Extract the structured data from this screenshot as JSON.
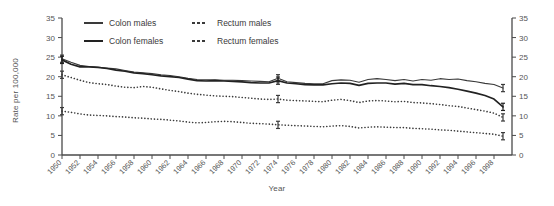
{
  "chart_data": {
    "type": "line",
    "title": "",
    "xlabel": "Year",
    "ylabel": "Rate per 100,000",
    "xlim": [
      1950,
      2000
    ],
    "ylim": [
      0,
      35
    ],
    "ytick_step": 5,
    "yticks": [
      0,
      5,
      10,
      15,
      20,
      25,
      30,
      35
    ],
    "xticks": [
      1950,
      1952,
      1954,
      1956,
      1958,
      1960,
      1962,
      1964,
      1966,
      1968,
      1970,
      1972,
      1974,
      1976,
      1978,
      1980,
      1982,
      1984,
      1986,
      1988,
      1990,
      1992,
      1994,
      1996,
      1998
    ],
    "xtick_labels": [
      "1950",
      "1952",
      "1954",
      "1956",
      "1958",
      "1960",
      "1962",
      "1964",
      "1966",
      "1968",
      "1970",
      "1972",
      "1974",
      "1976",
      "1978",
      "1980",
      "1982",
      "1984",
      "1986",
      "1988",
      "1990",
      "1992",
      "1994",
      "1996",
      "1998"
    ],
    "grid": false,
    "dual_y_axis": true,
    "legend_position": "top-left-inside",
    "error_bar_years": [
      1950,
      1974,
      1999
    ],
    "x": [
      1950,
      1951,
      1952,
      1953,
      1954,
      1955,
      1956,
      1957,
      1958,
      1959,
      1960,
      1961,
      1962,
      1963,
      1964,
      1965,
      1966,
      1967,
      1968,
      1969,
      1970,
      1971,
      1972,
      1973,
      1974,
      1975,
      1976,
      1977,
      1978,
      1979,
      1980,
      1981,
      1982,
      1983,
      1984,
      1985,
      1986,
      1987,
      1988,
      1989,
      1990,
      1991,
      1992,
      1993,
      1994,
      1995,
      1996,
      1997,
      1998,
      1999
    ],
    "series": [
      {
        "name": "Colon males",
        "style": "solid",
        "color": "#3a3a3a",
        "values": [
          24.6,
          23.7,
          22.9,
          22.6,
          22.4,
          22.2,
          22.0,
          21.6,
          21.2,
          21.0,
          20.8,
          20.5,
          20.3,
          20.0,
          19.6,
          19.3,
          19.2,
          19.2,
          19.1,
          19.1,
          19.0,
          18.9,
          18.8,
          18.7,
          19.6,
          18.7,
          18.5,
          18.3,
          18.2,
          18.2,
          19.0,
          19.2,
          19.1,
          18.6,
          19.3,
          19.5,
          19.3,
          19.0,
          19.3,
          18.9,
          19.3,
          19.1,
          19.5,
          19.3,
          19.4,
          19.0,
          18.7,
          18.3,
          18.0,
          17.1
        ]
      },
      {
        "name": "Colon females",
        "style": "solid-thick",
        "color": "#222222",
        "values": [
          24.3,
          23.2,
          22.5,
          22.5,
          22.4,
          22.1,
          21.7,
          21.4,
          21.0,
          20.8,
          20.5,
          20.2,
          20.0,
          19.8,
          19.4,
          19.0,
          18.9,
          19.0,
          18.9,
          18.8,
          18.7,
          18.5,
          18.4,
          18.4,
          19.0,
          18.4,
          18.2,
          18.0,
          17.9,
          17.9,
          18.2,
          18.4,
          18.3,
          17.8,
          18.3,
          18.4,
          18.4,
          18.1,
          18.3,
          18.0,
          18.0,
          17.7,
          17.5,
          17.2,
          16.8,
          16.3,
          15.8,
          15.2,
          14.3,
          12.3
        ]
      },
      {
        "name": "Rectum males",
        "style": "dotted",
        "color": "#3a3a3a",
        "values": [
          20.5,
          19.8,
          19.1,
          18.5,
          18.2,
          18.0,
          17.6,
          17.3,
          17.2,
          17.5,
          17.3,
          16.9,
          16.5,
          16.2,
          15.8,
          15.5,
          15.3,
          15.1,
          15.0,
          14.9,
          14.7,
          14.5,
          14.3,
          14.2,
          14.3,
          14.0,
          13.9,
          13.8,
          13.7,
          13.6,
          14.0,
          14.2,
          13.9,
          13.4,
          13.8,
          13.9,
          13.8,
          13.6,
          13.7,
          13.4,
          13.3,
          13.1,
          12.9,
          12.6,
          12.4,
          12.0,
          11.6,
          11.2,
          10.7,
          9.6
        ]
      },
      {
        "name": "Rectum females",
        "style": "dotted",
        "color": "#3a3a3a",
        "values": [
          11.2,
          10.9,
          10.5,
          10.2,
          10.1,
          10.0,
          9.8,
          9.7,
          9.5,
          9.4,
          9.2,
          9.1,
          8.9,
          8.7,
          8.4,
          8.2,
          8.3,
          8.5,
          8.6,
          8.5,
          8.3,
          8.1,
          8.0,
          7.9,
          7.7,
          7.6,
          7.5,
          7.4,
          7.3,
          7.2,
          7.4,
          7.5,
          7.3,
          6.9,
          7.1,
          7.2,
          7.1,
          7.0,
          7.0,
          6.8,
          6.7,
          6.6,
          6.4,
          6.3,
          6.1,
          5.9,
          5.7,
          5.5,
          5.3,
          4.8
        ]
      }
    ]
  },
  "axes": {
    "ylabel": "Rate per 100,000",
    "xlabel": "Year"
  },
  "legend": {
    "items": [
      {
        "label": "Colon males",
        "marker": "solid-line"
      },
      {
        "label": "Rectum males",
        "marker": "dotted-line"
      },
      {
        "label": "Colon females",
        "marker": "solid-thick-line"
      },
      {
        "label": "Rectum females",
        "marker": "dotted-line"
      }
    ]
  }
}
